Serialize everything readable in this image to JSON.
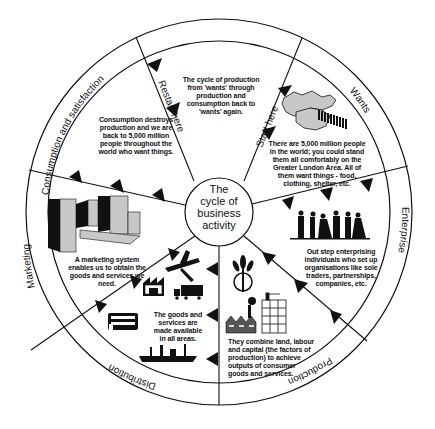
{
  "diagram": {
    "title": "The cycle of business activity",
    "center_lines": [
      "The",
      "cycle of",
      "business",
      "activity"
    ],
    "colors": {
      "line": "#111111",
      "fill_gray": "#c8c8c8",
      "dark": "#1a1a1a",
      "background": "#ffffff"
    },
    "segments": [
      {
        "id": "wants",
        "ring_label": "Wants",
        "description": "There are 5,000 million people in the world; you could stand them all comfortably on the Greater London Area. All of them want things - food, clothing, shelter, etc.",
        "icon": "greater-london-map-with-crowd"
      },
      {
        "id": "enterprise",
        "ring_label": "Enterprise",
        "description": "Out step enterprising individuals who set up organisations like sole traders, partnerships, companies, etc.",
        "icon": "people-silhouettes"
      },
      {
        "id": "production",
        "ring_label": "Production",
        "description": "They combine land, labour and capital (the factors of production) to achieve outputs of consumer goods and services.",
        "icon": "wheat-factory-building"
      },
      {
        "id": "distribution",
        "ring_label": "Distribution",
        "description": "The goods and services are made available in all areas.",
        "icon": "plane-warehouse-truck-bus-ship",
        "warehouse_sign": "Warehouse"
      },
      {
        "id": "marketing",
        "ring_label": "Marketing",
        "description": "A marketing system enables us to obtain the goods and services we need.",
        "icon": "shop-buildings"
      },
      {
        "id": "consumption",
        "ring_label": "Consumption and satisfaction",
        "description": "Consumption destroys production and we are back to 5,000 million people throughout  the world who want things.",
        "icon": "none"
      },
      {
        "id": "cycle",
        "ring_label": "",
        "description": "The cycle of production from 'wants' through production and consumption back to 'wants' again.",
        "icon": "none"
      }
    ],
    "spoke_labels": {
      "start": "Start here",
      "restart": "Restart here"
    }
  }
}
